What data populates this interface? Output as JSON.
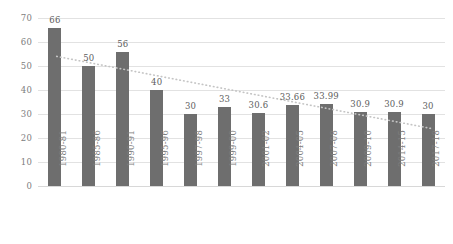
{
  "chart_data": {
    "type": "bar",
    "title": "",
    "xlabel": "",
    "ylabel": "",
    "categories": [
      "1980-81",
      "1985-86",
      "1990-91",
      "1995-96",
      "1997-98",
      "1999-00",
      "2001-02",
      "2004-05",
      "2007-08",
      "2009-10",
      "2014-15",
      "2017-18"
    ],
    "values": [
      66,
      50,
      56,
      40,
      30,
      33,
      30.6,
      33.66,
      33.99,
      30.9,
      30.9,
      30
    ],
    "value_labels": [
      "66",
      "50",
      "56",
      "40",
      "30",
      "33",
      "30.6",
      "33.66",
      "33.99",
      "30.9",
      "30.9",
      "30"
    ],
    "ylim": [
      0,
      70
    ],
    "ytick_labels": [
      "0",
      "10",
      "20",
      "30",
      "40",
      "50",
      "60",
      "70"
    ],
    "ytick_values": [
      0,
      10,
      20,
      30,
      40,
      50,
      60,
      70
    ],
    "grid": true,
    "legend": "none",
    "series": [
      {
        "name": "bars",
        "values": [
          66,
          50,
          56,
          40,
          30,
          33,
          30.6,
          33.66,
          33.99,
          30.9,
          30.9,
          30
        ],
        "color": "#6e6e6e"
      },
      {
        "name": "trendline",
        "type": "linear-trend-dotted",
        "start_value": 54,
        "end_value": 24,
        "color": "#c4c4c4",
        "style": "dotted"
      }
    ]
  },
  "colors": {
    "bar": "#6e6e6e",
    "gridline": "#e2e2e2",
    "axis_text": "#7d7d7d",
    "label_text": "#5d5d5d",
    "trendline": "#c4c4c4",
    "background": "#ffffff"
  }
}
